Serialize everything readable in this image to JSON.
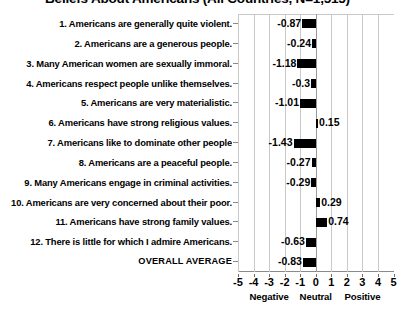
{
  "chart_data": {
    "type": "bar",
    "orientation": "horizontal",
    "title": "Beliefs About Americans (All Countries, N=1,515)",
    "xlabel": "",
    "ylabel": "",
    "xlim": [
      -5,
      5
    ],
    "grid": true,
    "legend": null,
    "xticks": [
      "-5",
      "-4",
      "-3",
      "-2",
      "-1",
      "0",
      "1",
      "2",
      "3",
      "4",
      "5"
    ],
    "xtick_values": [
      -5,
      -4,
      -3,
      -2,
      -1,
      0,
      1,
      2,
      3,
      4,
      5
    ],
    "axis_bands": [
      {
        "label": "Negative",
        "center": -3
      },
      {
        "label": "Neutral",
        "center": 0
      },
      {
        "label": "Positive",
        "center": 3
      }
    ],
    "categories": [
      "1. Americans are generally quite violent.",
      "2. Americans are a generous people.",
      "3. Many American women are sexually immoral.",
      "4. Americans respect people unlike themselves.",
      "5. Americans are very materialistic.",
      "6. Americans have strong religious values.",
      "7. Americans like to dominate other people",
      "8. Americans are a peaceful people.",
      "9. Many Americans engage in criminal activities.",
      "10. Americans are very concerned about their poor.",
      "11. Americans have strong family values.",
      "12. There is little for which I admire Americans.",
      "OVERALL AVERAGE"
    ],
    "values": [
      -0.87,
      -0.24,
      -1.18,
      -0.3,
      -1.01,
      0.15,
      -1.43,
      -0.27,
      -0.29,
      0.29,
      0.74,
      -0.63,
      -0.83
    ],
    "value_labels": [
      "-0.87",
      "-0.24",
      "-1.18",
      "-0.3",
      "-1.01",
      "0.15",
      "-1.43",
      "-0.27",
      "-0.29",
      "0.29",
      "0.74",
      "-0.63",
      "-0.83"
    ],
    "bar_color": "#000000",
    "grid_color": "#c9c9c9"
  }
}
